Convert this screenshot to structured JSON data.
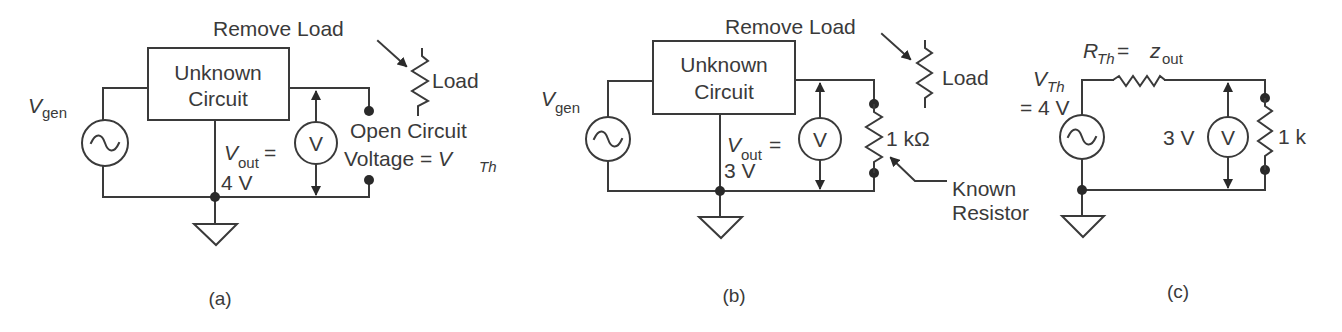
{
  "figure": {
    "panels": [
      {
        "id": "a",
        "caption": "(a)",
        "box": {
          "line1": "Unknown",
          "line2": "Circuit"
        },
        "source_label": {
          "main": "V",
          "sub": "gen"
        },
        "remove_load": "Remove Load",
        "load_label": "Load",
        "vout_label": {
          "main": "V",
          "sub": "out",
          "eq": "="
        },
        "vout_value": "4 V",
        "meter": "V",
        "open_circuit_line1": "Open Circuit",
        "open_circuit_line2_prefix": "Voltage = ",
        "open_circuit_vth": {
          "main": "V",
          "sub": "Th"
        }
      },
      {
        "id": "b",
        "caption": "(b)",
        "box": {
          "line1": "Unknown",
          "line2": "Circuit"
        },
        "source_label": {
          "main": "V",
          "sub": "gen"
        },
        "remove_load": "Remove Load",
        "load_label": "Load",
        "vout_label": {
          "main": "V",
          "sub": "out",
          "eq": "="
        },
        "vout_value": "3 V",
        "meter": "V",
        "resistor_label": "1 kΩ",
        "known_resistor_line1": "Known",
        "known_resistor_line2": "Resistor"
      },
      {
        "id": "c",
        "caption": "(c)",
        "rth_label": {
          "main": "R",
          "sub": "Th",
          "eq": " = ",
          "z": "z",
          "zsub": "out"
        },
        "vth_label": {
          "main": "V",
          "sub": "Th",
          "eq_value": "= 4 V"
        },
        "meter_reading": "3 V",
        "meter": "V",
        "resistor_label": "1 k"
      }
    ]
  }
}
